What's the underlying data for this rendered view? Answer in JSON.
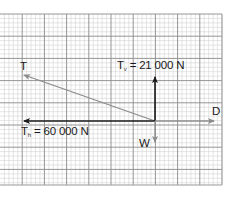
{
  "diagram": {
    "type": "force-vector-diagram",
    "background": "graph-paper",
    "colors": {
      "grid_minor": "#d4d4d4",
      "grid_major": "#8a8a8a",
      "vector_dark": "#1a1a1a",
      "vector_grey": "#8c8c8c",
      "border": "#9a9a9a"
    },
    "grid": {
      "x0": 0,
      "y0": 14,
      "width": 222,
      "height": 171,
      "major_spacing": 22.2,
      "minor_divisions": 5
    },
    "origin": {
      "x": 155,
      "y": 121
    },
    "vectors": [
      {
        "id": "T",
        "label": "T",
        "from": [
          155,
          121
        ],
        "to": [
          24,
          75
        ],
        "color": "grey"
      },
      {
        "id": "Tv",
        "label": "Tv",
        "from": [
          155,
          121
        ],
        "to": [
          155,
          77
        ],
        "color": "dark"
      },
      {
        "id": "Th",
        "label": "Th",
        "from": [
          155,
          121
        ],
        "to": [
          24,
          121
        ],
        "color": "dark"
      },
      {
        "id": "D",
        "label": "D",
        "from": [
          155,
          121
        ],
        "to": [
          214,
          121
        ],
        "color": "grey"
      },
      {
        "id": "W",
        "label": "W",
        "from": [
          155,
          121
        ],
        "to": [
          155,
          142
        ],
        "color": "grey"
      }
    ]
  },
  "labels": {
    "T": {
      "symbol": "T"
    },
    "Tv": {
      "symbol": "T",
      "subscript": "v",
      "equals": "=",
      "value": "21 000 N"
    },
    "Th": {
      "symbol": "T",
      "subscript": "h",
      "equals": "=",
      "value": "60 000 N"
    },
    "D": {
      "symbol": "D"
    },
    "W": {
      "symbol": "W"
    }
  }
}
